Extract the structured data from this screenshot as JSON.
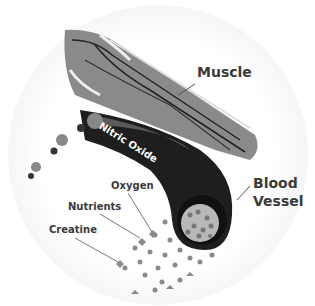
{
  "diagram": {
    "labels": {
      "muscle": "Muscle",
      "blood_vessel_line1": "Blood",
      "blood_vessel_line2": "Vessel",
      "nitric_oxide": "Nitric Oxide",
      "oxygen": "Oxygen",
      "nutrients": "Nutrients",
      "creatine": "Creatine"
    },
    "colors": {
      "label_text": "#3a3a3a",
      "muscle_fill": "#8a8a8a",
      "vessel_fill": "#1e1e1e",
      "background": "#ffffff"
    }
  }
}
